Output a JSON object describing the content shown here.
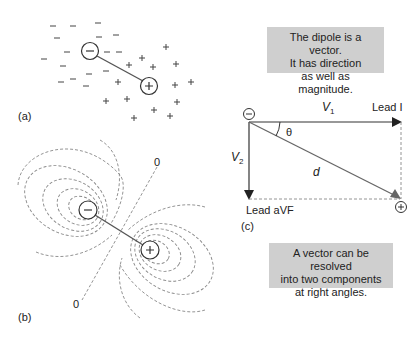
{
  "panels": {
    "a": {
      "label": "(a)"
    },
    "b": {
      "label": "(b)",
      "zero_labels": [
        "0",
        "0"
      ]
    },
    "c": {
      "label": "(c)",
      "note_top": [
        "The dipole is a vector.",
        "It has direction",
        "as well as magnitude."
      ],
      "note_bottom": [
        "A vector can be resolved",
        "into two components",
        "at right angles."
      ],
      "v1": "V",
      "v1_sub": "1",
      "v2": "V",
      "v2_sub": "2",
      "d": "d",
      "theta": "θ",
      "lead_i": "Lead I",
      "lead_avf": "Lead aVF",
      "neg_symbol": "−",
      "pos_symbol": "+"
    }
  },
  "colors": {
    "line": "#555555",
    "dash": "#888888",
    "note_bg": "#cfcfcf",
    "text": "#222222"
  }
}
